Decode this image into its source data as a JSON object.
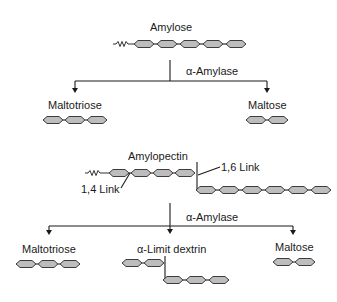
{
  "amylose": {
    "title": "Amylose",
    "chain_units": 5
  },
  "amylose_reaction": {
    "enzyme": "α-Amylase",
    "products": [
      {
        "name": "Maltotriose",
        "units": 3
      },
      {
        "name": "Maltose",
        "units": 2
      }
    ]
  },
  "amylopectin": {
    "title": "Amylopectin",
    "main_chain_units": 4,
    "branch_chain_units": 6,
    "link_labels": {
      "alpha_1_4": "1,4 Link",
      "alpha_1_6": "1,6 Link"
    }
  },
  "amylopectin_reaction": {
    "enzyme": "α-Amylase",
    "products": [
      {
        "name": "Maltotriose",
        "units": 3
      },
      {
        "name": "α-Limit dextrin",
        "main_units": 2,
        "branch_units": 3
      },
      {
        "name": "Maltose",
        "units": 2
      }
    ]
  },
  "colors": {
    "glucose_fill": "#bdbdbd",
    "outline": "#2a2a2a",
    "line": "#1a1a1a",
    "background": "#ffffff"
  }
}
